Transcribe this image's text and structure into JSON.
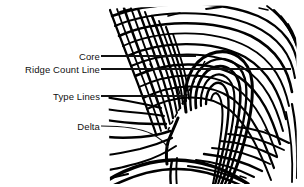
{
  "figure": {
    "kind": "fingerprint-classification-diagram",
    "pattern_type": "loop",
    "background_color": "#ffffff",
    "ink_color": "#000000",
    "leader_line_color": "#111111",
    "image_bounds": {
      "x": 105,
      "y": 5,
      "width": 190,
      "height": 176
    },
    "labels": [
      {
        "id": "core",
        "text": "Core",
        "leader_y": 56,
        "leader_from_x": 100,
        "leader_to_x": 196,
        "style": "solid-horizontal"
      },
      {
        "id": "ridge-count-line",
        "text": "Ridge Count Line",
        "leader_y": 69,
        "leader_from_x": 100,
        "leader_to_x": 290,
        "style": "solid-horizontal"
      },
      {
        "id": "type-lines",
        "text": "Type Lines",
        "leader_y": 96,
        "leader_from_x": 100,
        "leader_to_x": 185,
        "style": "solid-horizontal"
      },
      {
        "id": "delta",
        "text": "Delta",
        "leader_y": 126,
        "leader_from_x": 100,
        "leader_to_x": 168,
        "style": "curved"
      }
    ],
    "annotations": {
      "ridge_count_dashed_line": {
        "description": "dashed diagonal from core to delta",
        "from": [
          203,
          63
        ],
        "to": [
          168,
          131
        ]
      }
    }
  }
}
